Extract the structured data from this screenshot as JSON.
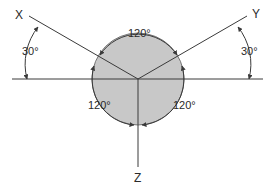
{
  "diagram": {
    "type": "isometric-axes",
    "colors": {
      "circle_fill": "#c8c8c8",
      "line": "#3a3a3a",
      "text": "#2a2a2a",
      "background": "#ffffff"
    },
    "axes": {
      "x_label": "X",
      "y_label": "Y",
      "z_label": "Z"
    },
    "angles": {
      "top": "120°",
      "bottom_left": "120°",
      "bottom_right": "120°",
      "left_incline": "30°",
      "right_incline": "30°"
    }
  }
}
